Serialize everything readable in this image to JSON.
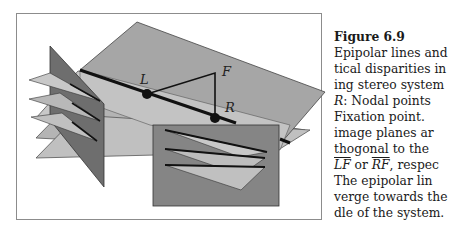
{
  "figure": {
    "labels": {
      "left_nodal": "L",
      "right_nodal": "R",
      "fixation": "F"
    },
    "colors": {
      "frame_border": "#8c8c8c",
      "main_plane": "#a6a6a6",
      "light_plane": "#c8c8c8",
      "mid_plane": "#b4b4b4",
      "dark_image_plane": "#6e6e6e",
      "right_image_plane": "#858585",
      "line": "#111111"
    }
  },
  "caption": {
    "title": "Figure 6.9",
    "lines": [
      "Epipolar lines and",
      "tical disparities in",
      "ing stereo system",
      "R:  Nodal points",
      "Fixation  point.",
      "image  planes  ar",
      "thogonal  to  the",
      "LF or RF, respec",
      "The  epipolar  lin",
      "verge towards the",
      "dle of the system."
    ],
    "line4_italic": "R",
    "line4_rest": ":  Nodal points",
    "line8_ov1": "LF",
    "line8_mid": " or ",
    "line8_ov2": "RF",
    "line8_rest": ", respec"
  }
}
